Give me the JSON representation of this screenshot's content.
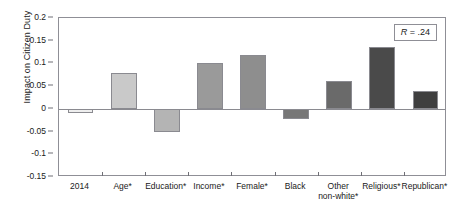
{
  "chart_data": {
    "type": "bar",
    "title": "",
    "xlabel": "",
    "ylabel": "Impact on Citizen Duty",
    "categories": [
      "2014",
      "Age*",
      "Education*",
      "Income*",
      "Female*",
      "Black",
      "Other\nnon-white*",
      "Religious*",
      "Republican*"
    ],
    "values": [
      -0.01,
      0.08,
      -0.05,
      0.101,
      0.119,
      -0.022,
      0.061,
      0.136,
      0.04
    ],
    "bar_colors": [
      "#eeeeee",
      "#c9c9c9",
      "#b4b4b4",
      "#9a9a9a",
      "#8e8e8e",
      "#777777",
      "#6a6a6a",
      "#4a4a4a",
      "#3f3f3f"
    ],
    "ylim": [
      -0.15,
      0.2
    ],
    "yticks": [
      0.2,
      0.15,
      0.1,
      0.05,
      0,
      -0.05,
      -0.1,
      -0.15
    ],
    "ytick_labels": [
      "0.2",
      "0.15",
      "0.1",
      "0.05",
      "0",
      "-0.05",
      "-0.1",
      "-0.15"
    ],
    "grid": false,
    "legend": "none",
    "annotations": [
      {
        "name": "r-value",
        "symbol": "R",
        "text": " = .24"
      }
    ]
  }
}
